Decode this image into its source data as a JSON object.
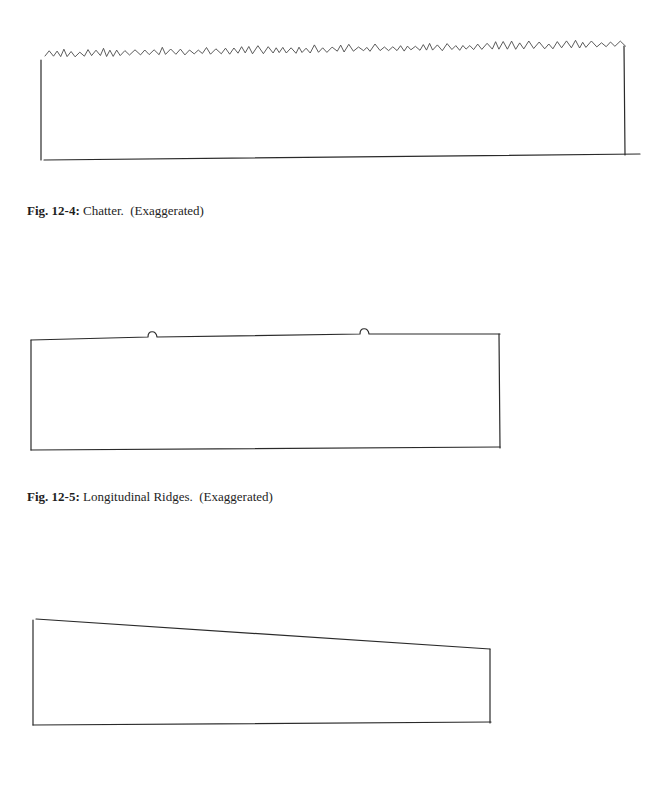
{
  "figures": [
    {
      "id": "fig-12-4",
      "label": "Fig. 12-4:",
      "title": "Chatter.",
      "note": "(Exaggerated)",
      "depiction": "rectangle with zig-zag (chatter marks) along the top edge"
    },
    {
      "id": "fig-12-5",
      "label": "Fig. 12-5:",
      "title": "Longitudinal Ridges.",
      "note": "(Exaggerated)",
      "depiction": "rectangle with two small semicircular ridges on the top edge"
    },
    {
      "id": "fig-12-6",
      "depiction": "quadrilateral with top edge sloping down from left to right (taper)"
    }
  ],
  "colors": {
    "ink": "#2a2a2a",
    "paper": "#ffffff"
  }
}
